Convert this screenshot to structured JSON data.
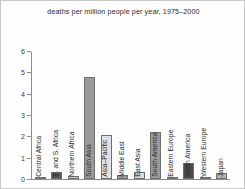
{
  "chart_data": {
    "type": "bar",
    "title": "deaths per million people per year, 1975–2000",
    "xlabel": "",
    "ylabel": "",
    "ylim": [
      0,
      6
    ],
    "yticks": [
      0,
      1,
      2,
      3,
      4,
      5,
      6
    ],
    "ytick_labels": [
      "0",
      "1",
      "2",
      "3",
      "4",
      "5",
      "6"
    ],
    "grid": false,
    "legend": "none",
    "categories": [
      "Central Africa",
      "E. and S. Africa",
      "Northern Africa",
      "South Asia",
      "Asia–Pacific",
      "Middle East",
      "East Asia",
      "South America",
      "Eastern Europe",
      "North America",
      "Western Europe",
      "Japan"
    ],
    "values": [
      0.03,
      0.33,
      0.13,
      4.8,
      2.05,
      0.18,
      0.35,
      2.2,
      0.05,
      0.75,
      0.1,
      0.3
    ],
    "bar_colors": [
      "#9a9a9a",
      "#565656",
      "#c9c9c9",
      "#9a9a9a",
      "#e2e2e2",
      "#9a9a9a",
      "#dcdcdc",
      "#9a9a9a",
      "#9a9a9a",
      "#4a4a4a",
      "#c9c9c9",
      "#b5b5b5"
    ]
  },
  "colors": {
    "axis": "#8d8d8d",
    "text": "#2b2b2b",
    "background": "#fefefe",
    "frame": "#c8c8c8"
  }
}
